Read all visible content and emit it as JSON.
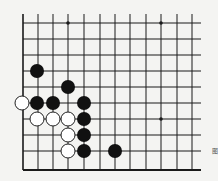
{
  "diagram": {
    "type": "go-board-fragment",
    "line_color": "#1a1a1a",
    "background": "#f4f4f2",
    "columns_x": [
      23,
      38,
      53,
      68,
      84,
      100,
      115,
      130,
      146,
      161,
      177,
      192
    ],
    "rows_y": [
      23,
      39,
      55,
      71,
      87,
      103,
      119,
      135,
      151
    ],
    "bottom_edge_y": 170,
    "left_edge_x": 23,
    "grid_top_y": 14,
    "grid_right_x": 201,
    "star_points": [
      [
        68,
        23
      ],
      [
        161,
        23
      ],
      [
        161,
        119
      ]
    ],
    "black_stones": [
      [
        37,
        71
      ],
      [
        68,
        87
      ],
      [
        37,
        103
      ],
      [
        53,
        103
      ],
      [
        84,
        103
      ],
      [
        84,
        119
      ],
      [
        84,
        135
      ],
      [
        84,
        151
      ],
      [
        115,
        151
      ]
    ],
    "white_stones": [
      [
        22,
        103
      ],
      [
        37,
        119
      ],
      [
        53,
        119
      ],
      [
        68,
        119
      ],
      [
        68,
        135
      ],
      [
        68,
        151
      ]
    ],
    "stone_radius": 7
  },
  "caption": "图"
}
